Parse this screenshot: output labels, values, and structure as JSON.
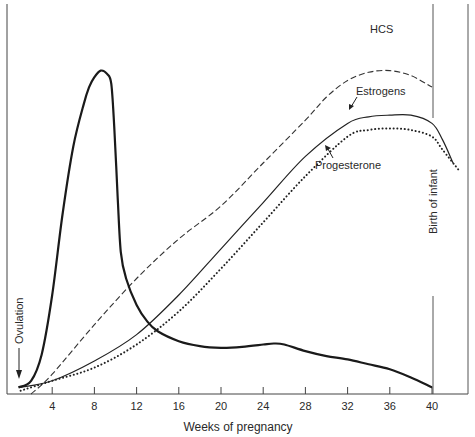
{
  "chart_data": {
    "type": "line",
    "title": "",
    "xlabel": "Weeks of pregnancy",
    "ylabel": "",
    "xlim": [
      0,
      42.5
    ],
    "ylim": [
      0,
      100
    ],
    "x_ticks": [
      4,
      8,
      12,
      16,
      20,
      24,
      28,
      32,
      36,
      40
    ],
    "grid": false,
    "legend": "inline labels",
    "series": [
      {
        "name": "HCG",
        "label_visible": false,
        "style": "solid-bold",
        "x": [
          0.8,
          2,
          3,
          4,
          5,
          6,
          7,
          7.5,
          8,
          8.6,
          9.2,
          9.6,
          9.9,
          10.2,
          10.5,
          11,
          12,
          13,
          14,
          16,
          18,
          20,
          22,
          24,
          25,
          26,
          28,
          30,
          32,
          34,
          36,
          38,
          40
        ],
        "y": [
          2,
          4,
          12,
          30,
          55,
          75,
          88,
          93,
          96,
          98,
          97,
          94,
          80,
          60,
          43,
          35,
          27,
          22,
          19,
          16,
          14.5,
          14,
          14.3,
          15,
          15.3,
          15,
          13,
          11.5,
          10.5,
          9,
          7.5,
          5,
          2
        ]
      },
      {
        "name": "HCS",
        "label_visible": true,
        "style": "dashed",
        "x": [
          2,
          4,
          8,
          12,
          16,
          20,
          24,
          28,
          30,
          32,
          34,
          36,
          38,
          40
        ],
        "y": [
          0,
          6,
          21,
          35,
          47,
          57,
          70,
          83,
          90,
          95,
          97.5,
          98,
          96.5,
          93
        ]
      },
      {
        "name": "Estrogens",
        "label_visible": true,
        "style": "solid-thin",
        "x": [
          1,
          4,
          8,
          12,
          16,
          20,
          24,
          28,
          32,
          34,
          36,
          38,
          40,
          41,
          42
        ],
        "y": [
          2,
          4,
          10,
          18,
          30,
          44,
          58,
          72,
          82,
          84,
          84.5,
          84.5,
          82,
          77,
          70
        ]
      },
      {
        "name": "Progesterone",
        "label_visible": true,
        "style": "dotted",
        "x": [
          1,
          4,
          8,
          12,
          16,
          20,
          24,
          28,
          32,
          34,
          36,
          38,
          40,
          41,
          42.5
        ],
        "y": [
          1,
          4,
          8,
          15,
          25,
          38,
          52,
          66,
          78,
          80,
          80.5,
          80,
          78,
          74,
          68
        ]
      }
    ],
    "annotations": [
      {
        "text": "Ovulation",
        "orientation": "vertical",
        "arrow": "down",
        "x_week": 0.8
      },
      {
        "text": "Birth of infant",
        "orientation": "vertical",
        "line_at_week": 40
      },
      {
        "text": "HCS",
        "points_to": "HCS"
      },
      {
        "text": "Estrogens",
        "arrow_to": "Estrogens"
      },
      {
        "text": "Progesterone",
        "arrow_to": "Progesterone"
      }
    ]
  },
  "labels": {
    "hcs": "HCS",
    "estrogens": "Estrogens",
    "progesterone": "Progesterone",
    "ovulation": "Ovulation",
    "birth": "Birth of infant",
    "xlabel": "Weeks of pregnancy"
  },
  "ticks": [
    "4",
    "8",
    "12",
    "16",
    "20",
    "24",
    "28",
    "32",
    "36",
    "40"
  ]
}
